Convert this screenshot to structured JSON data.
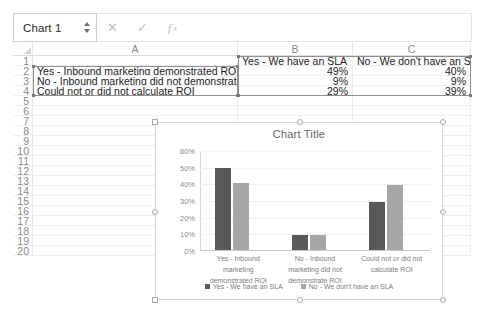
{
  "formula_bar": {
    "name_box_value": "Chart 1",
    "cancel_icon": "times-icon",
    "confirm_icon": "check-icon",
    "function_icon": "fx-icon",
    "formula_value": ""
  },
  "sheet": {
    "column_headers": [
      "A",
      "B",
      "C"
    ],
    "row_headers": [
      "1",
      "2",
      "3",
      "4",
      "5",
      "6",
      "7",
      "8",
      "9",
      "10",
      "11",
      "12",
      "13",
      "14",
      "15",
      "16",
      "17",
      "18",
      "19",
      "20"
    ],
    "cells": {
      "B1": "Yes - We have an SLA",
      "C1": "No - We don't have an SLA",
      "A2": "Yes - Inbound marketing demonstrated ROI",
      "B2": "49%",
      "C2": "40%",
      "A3": "No - Inbound marketing did not demonstrate ROI",
      "B3": "9%",
      "C3": "9%",
      "A4": "Could not or did not calculate ROI",
      "B4": "29%",
      "C4": "39%"
    }
  },
  "chart_data": {
    "type": "bar",
    "title": "Chart Title",
    "xlabel": "",
    "ylabel": "",
    "ylim": [
      0,
      0.6
    ],
    "ytick_labels": [
      "0%",
      "10%",
      "20%",
      "30%",
      "40%",
      "50%",
      "60%"
    ],
    "ytick_values": [
      0,
      0.1,
      0.2,
      0.3,
      0.4,
      0.5,
      0.6
    ],
    "grid": true,
    "legend_position": "bottom",
    "categories": [
      "Yes - Inbound marketing demonstrated ROI",
      "No - Inbound marketing did not demonstrate ROI",
      "Could not or did not calculate ROI"
    ],
    "series": [
      {
        "name": "Yes - We have an SLA",
        "color": "#595959",
        "values": [
          0.49,
          0.09,
          0.29
        ]
      },
      {
        "name": "No - We don't have an SLA",
        "color": "#a6a6a6",
        "values": [
          0.4,
          0.09,
          0.39
        ]
      }
    ]
  }
}
